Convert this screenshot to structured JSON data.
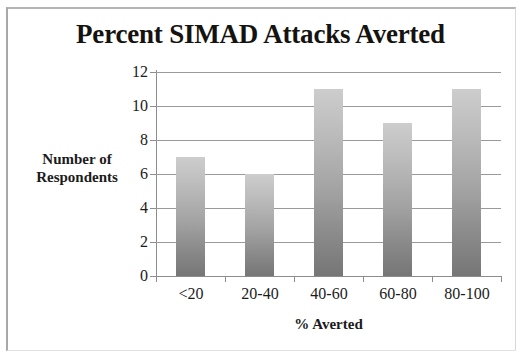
{
  "chart_data": {
    "type": "bar",
    "title": "Percent SIMAD Attacks Averted",
    "xlabel": "% Averted",
    "ylabel_line1": "Number of",
    "ylabel_line2": "Respondents",
    "categories": [
      "<20",
      "20-40",
      "40-60",
      "60-80",
      "80-100"
    ],
    "values": [
      7,
      6,
      11,
      9,
      11
    ],
    "ylim": [
      0,
      12
    ],
    "ytick_labels": [
      "12",
      "10",
      "8",
      "6",
      "4",
      "2",
      "0"
    ],
    "ytick_values": [
      12,
      10,
      8,
      6,
      4,
      2,
      0
    ],
    "grid": true,
    "legend": "none",
    "bar_color_top": "#cdcdcd",
    "bar_color_bottom": "#767676",
    "axis_color": "#8d8d8d",
    "grid_color": "#9a9a9a",
    "text_color": "#1b1b1b",
    "background": "#ffffff"
  }
}
